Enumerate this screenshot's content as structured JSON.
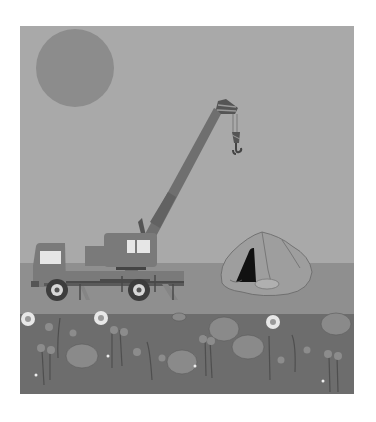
{
  "scene": {
    "description": "Grayscale illustration of a mobile crane truck next to a rock cave, with flowers in the foreground",
    "frame": {
      "x": 20,
      "y": 26,
      "width": 334,
      "height": 368
    },
    "colors": {
      "background": "#ffffff",
      "sky": "#a9a9a9",
      "sun": "#8c8c8c",
      "ground_mid": "#8f8f8f",
      "ground_dark": "#6d6d6d",
      "truck_body": "#7a7a7a",
      "truck_dark": "#4a4a4a",
      "window": "#e6e6e6",
      "rock": "#9e9e9e",
      "cave": "#111111",
      "flower_light": "#d9d9d9"
    },
    "objects": [
      {
        "name": "sun",
        "label": "Sun"
      },
      {
        "name": "crane-truck",
        "label": "Crane truck"
      },
      {
        "name": "crane-boom",
        "label": "Telescopic boom"
      },
      {
        "name": "crane-hook",
        "label": "Hook"
      },
      {
        "name": "rock-cave",
        "label": "Rock cave"
      },
      {
        "name": "flower-field",
        "label": "Flowers"
      }
    ]
  }
}
